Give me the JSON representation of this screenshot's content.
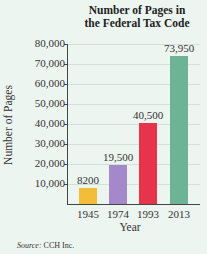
{
  "chart_data": {
    "type": "bar",
    "title": "Number of Pages in the Federal Tax Code",
    "title_lines": [
      "Number of Pages in",
      "the Federal Tax Code"
    ],
    "xlabel": "Year",
    "ylabel": "Number of Pages",
    "categories": [
      "1945",
      "1974",
      "1993",
      "2013"
    ],
    "values": [
      8200,
      19500,
      40500,
      73950
    ],
    "value_labels": [
      "8200",
      "19,500",
      "40,500",
      "73,950"
    ],
    "bar_colors": [
      "#f2be3a",
      "#a389c9",
      "#e7344b",
      "#6db497"
    ],
    "ylim": [
      0,
      80000
    ],
    "yticks": [
      10000,
      20000,
      30000,
      40000,
      50000,
      60000,
      70000,
      80000
    ],
    "ytick_labels": [
      "10,000",
      "20,000",
      "30,000",
      "40,000",
      "50,000",
      "60,000",
      "70,000",
      "80,000"
    ],
    "grid": true,
    "legend": null,
    "source": {
      "prefix": "Source:",
      "text": " CCH Inc."
    }
  }
}
